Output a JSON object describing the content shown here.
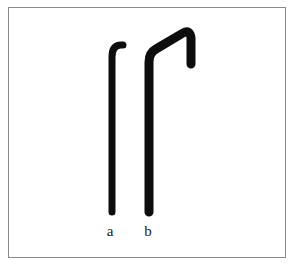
{
  "figure": {
    "caption_labels": [
      {
        "id": "a",
        "text": "a",
        "x": 110,
        "y": 231
      },
      {
        "id": "b",
        "text": "b",
        "x": 148,
        "y": 231
      }
    ],
    "colors": {
      "background": "#ffffff",
      "stroke": "#0d0d0d",
      "frame_border": "#8a8a8a",
      "label_text": "#1b1b1b"
    },
    "frame": {
      "left": 8,
      "top": 7,
      "width": 278,
      "height": 251,
      "border_width": 1
    },
    "shapes": [
      {
        "id": "a",
        "name": "hooked-rod-a",
        "description": "slender vertical rod with a short curved hook at the top bending to the right",
        "stroke_width": 7,
        "stem_x": 112,
        "stem_top_y": 52,
        "stem_bottom_y": 212,
        "hook_apex_y": 44,
        "hook_tip_x": 123,
        "hook_tip_y": 52
      },
      {
        "id": "b",
        "name": "hooked-rod-b",
        "description": "taller vertical rod rising into a long diagonal arm to a peak then descending on the right",
        "stroke_width": 9,
        "stem_x": 149,
        "stem_top_y": 60,
        "stem_bottom_y": 212,
        "elbow_x": 152,
        "elbow_y": 52,
        "peak_x": 188,
        "peak_y": 30,
        "right_arm_x": 192,
        "right_arm_bottom_y": 66
      }
    ]
  }
}
